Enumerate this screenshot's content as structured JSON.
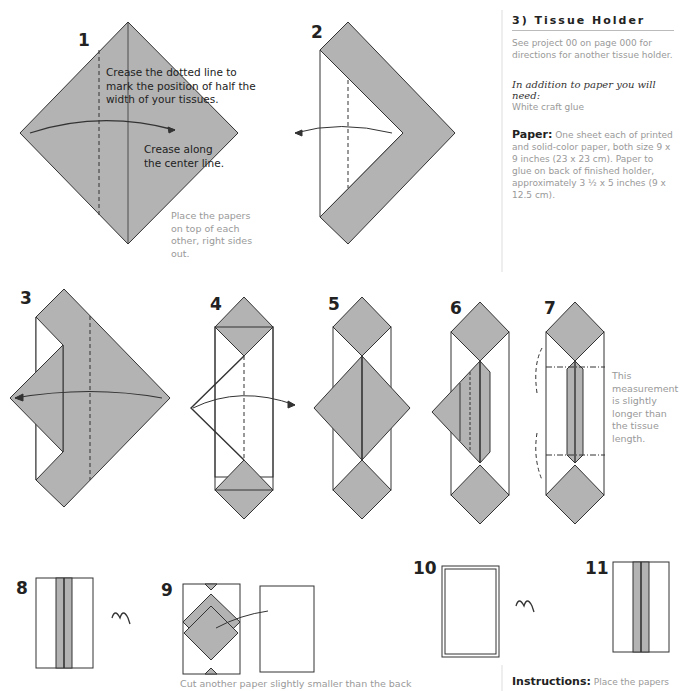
{
  "sidebar": {
    "title": "3) Tissue Holder",
    "intro": "See project 00 on page 000 for directions for another tissue holder.",
    "need_heading": "In addition to paper you will need:",
    "need_items": "White craft glue",
    "paper_label": "Paper:",
    "paper_text": "One sheet each of printed and solid-color paper, both size 9 x 9 inches (23 x 23 cm). Paper to glue on back of finished holder, approximately 3 ½ x 5 inches (9 x 12.5 cm).",
    "instructions_label": "Instructions:",
    "instructions_text": "Place the papers"
  },
  "steps": [
    {
      "num": "1",
      "notes": [
        "Crease the dotted line to mark the position of half the width of your tissues.",
        "Crease along the center line.",
        "Place the papers on top of each other, right sides out."
      ]
    },
    {
      "num": "2"
    },
    {
      "num": "3"
    },
    {
      "num": "4"
    },
    {
      "num": "5"
    },
    {
      "num": "6"
    },
    {
      "num": "7",
      "notes": [
        "This measurement is slightly longer than the tissue length."
      ]
    },
    {
      "num": "8"
    },
    {
      "num": "9",
      "notes": [
        "Cut another paper slightly smaller than the back"
      ]
    },
    {
      "num": "10"
    },
    {
      "num": "11"
    }
  ],
  "colors": {
    "paper_gray": "#b3b3b3",
    "line": "#333333",
    "note_text": "#999999"
  }
}
